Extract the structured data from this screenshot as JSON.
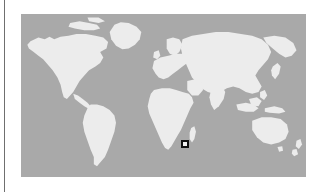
{
  "figure": {
    "kind": "world-locator-map",
    "projection": "equirectangular",
    "caption": ""
  },
  "colors": {
    "ocean": "#a9a9a9",
    "land": "#ececec",
    "background": "#ffffff",
    "marker_border": "#111111",
    "marker_fill": "#f2f2f2",
    "margin_rule": "#6f6f6f"
  },
  "map": {
    "frame": {
      "left": 21,
      "top": 14,
      "width": 285,
      "height": 163
    },
    "lon_range": [
      -180,
      180
    ],
    "lat_range": [
      -90,
      90
    ],
    "continents": [
      "North America",
      "South America",
      "Greenland",
      "Europe",
      "Africa",
      "Asia",
      "Australia",
      "Madagascar",
      "New Zealand",
      "Japan",
      "British Isles",
      "Indonesia"
    ]
  },
  "markers": [
    {
      "name": "study-site",
      "label": "",
      "region": "Southern Africa",
      "lon": 27.5,
      "lat": -20.5,
      "x": 181,
      "y": 140,
      "size": 8,
      "shape": "square"
    }
  ],
  "margin": {
    "rule_label": "",
    "rule_x": 4
  }
}
